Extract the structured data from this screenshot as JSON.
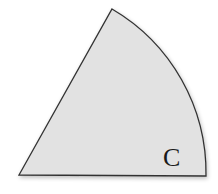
{
  "figure": {
    "shape": "circular-sector",
    "label": "C",
    "fill_color": "#e2e2e2",
    "stroke_color": "#333333"
  }
}
